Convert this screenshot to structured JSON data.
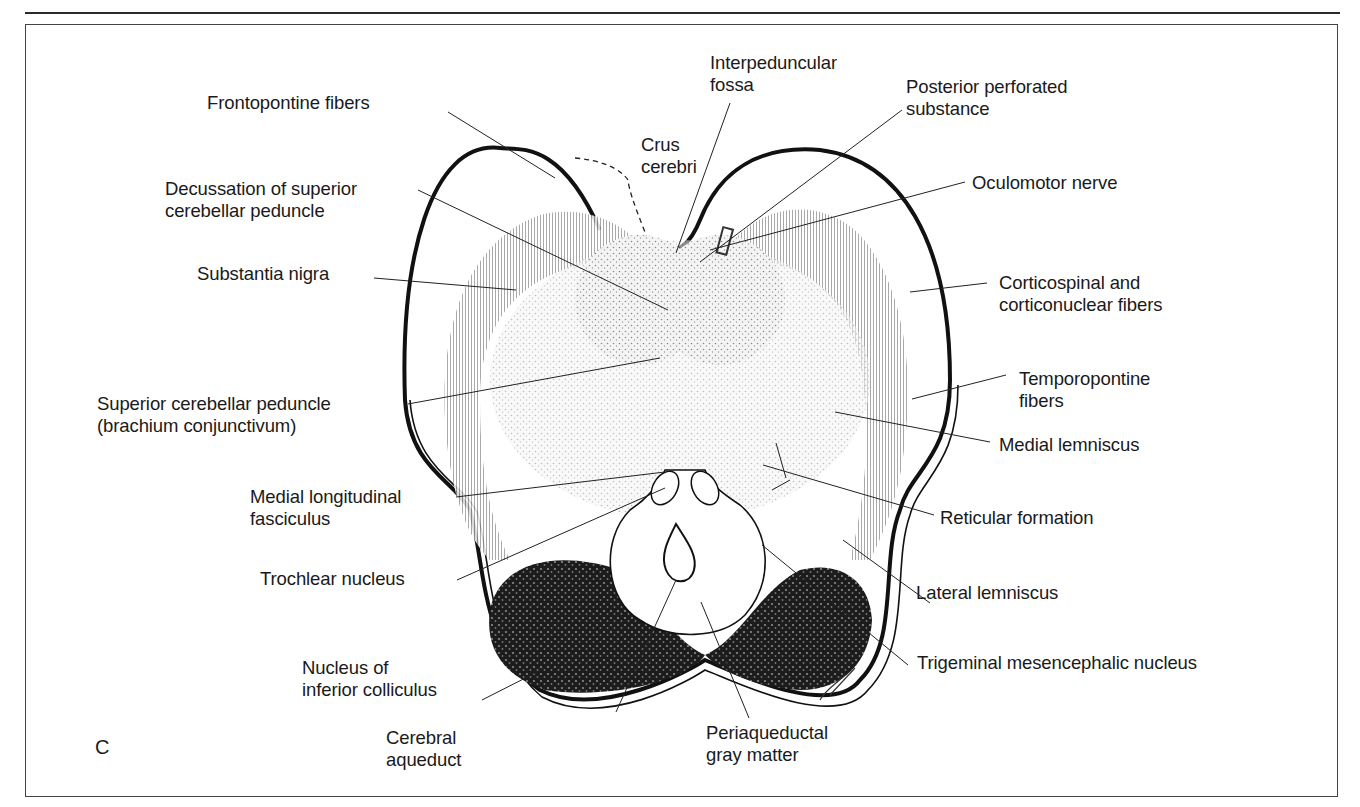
{
  "figure": {
    "panel_letter": "C",
    "labels_left": [
      {
        "id": "frontopontine",
        "lines": [
          "Frontopontine fibers"
        ]
      },
      {
        "id": "decussation",
        "lines": [
          "Decussation of superior",
          "cerebellar peduncle"
        ]
      },
      {
        "id": "substantia-nigra",
        "lines": [
          "Substantia nigra"
        ]
      },
      {
        "id": "sup-cerebellar-peduncle",
        "lines": [
          "Superior cerebellar peduncle",
          "(brachium conjunctivum)"
        ]
      },
      {
        "id": "mlf",
        "lines": [
          "Medial longitudinal",
          "fasciculus"
        ]
      },
      {
        "id": "trochlear",
        "lines": [
          "Trochlear nucleus"
        ]
      },
      {
        "id": "inf-colliculus",
        "lines": [
          "Nucleus of",
          "inferior colliculus"
        ]
      }
    ],
    "labels_top": [
      {
        "id": "crus-cerebri",
        "lines": [
          "Crus",
          "cerebri"
        ]
      },
      {
        "id": "interpeduncular",
        "lines": [
          "Interpeduncular",
          "fossa"
        ]
      },
      {
        "id": "post-perforated",
        "lines": [
          "Posterior perforated",
          "substance"
        ]
      }
    ],
    "labels_right": [
      {
        "id": "oculomotor",
        "lines": [
          "Oculomotor nerve"
        ]
      },
      {
        "id": "corticospinal",
        "lines": [
          "Corticospinal and",
          "corticonuclear fibers"
        ]
      },
      {
        "id": "temporopontine",
        "lines": [
          "Temporopontine",
          "fibers"
        ]
      },
      {
        "id": "medial-lemniscus",
        "lines": [
          "Medial lemniscus"
        ]
      },
      {
        "id": "reticular",
        "lines": [
          "Reticular formation"
        ]
      },
      {
        "id": "lateral-lemniscus",
        "lines": [
          "Lateral lemniscus"
        ]
      },
      {
        "id": "trigeminal-mes",
        "lines": [
          "Trigeminal mesencephalic nucleus"
        ]
      }
    ],
    "labels_bottom": [
      {
        "id": "aqueduct",
        "lines": [
          "Cerebral",
          "aqueduct"
        ]
      },
      {
        "id": "pag",
        "lines": [
          "Periaqueductal",
          "gray matter"
        ]
      }
    ]
  }
}
